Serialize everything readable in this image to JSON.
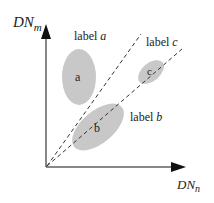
{
  "diagram": {
    "axes": {
      "y_label_main": "DN",
      "y_label_sub": "m",
      "x_label_main": "DN",
      "x_label_sub": "n"
    },
    "clusters": [
      {
        "id": "a",
        "inner_label": "a",
        "outer_label_prefix": "label ",
        "outer_label_var": "a"
      },
      {
        "id": "b",
        "inner_label": "b",
        "outer_label_prefix": "label ",
        "outer_label_var": "b"
      },
      {
        "id": "c",
        "inner_label": "c",
        "outer_label_prefix": "label ",
        "outer_label_var": "c"
      }
    ],
    "decision_lines": [
      {
        "id": "upper-dashed-line",
        "style": "dashed"
      },
      {
        "id": "lower-dashed-line",
        "style": "dashed"
      }
    ],
    "colors": {
      "ellipse_fill": "#c8c8c8",
      "axis": "#111111",
      "dash": "#333333",
      "text": "#222222"
    }
  }
}
